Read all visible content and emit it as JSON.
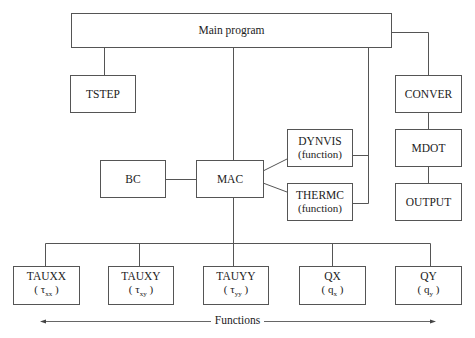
{
  "diagram": {
    "main": {
      "label": "Main program"
    },
    "tstep": {
      "label": "TSTEP"
    },
    "conver": {
      "label": "CONVER"
    },
    "mdot": {
      "label": "MDOT"
    },
    "output": {
      "label": "OUTPUT"
    },
    "bc": {
      "label": "BC"
    },
    "mac": {
      "label": "MAC"
    },
    "dynvis": {
      "label": "DYNVIS",
      "sub": "(function)"
    },
    "thermc": {
      "label": "THERMC",
      "sub": "(function)"
    },
    "functions": [
      {
        "label": "TAUXX",
        "sym": "τ",
        "subscript": "xx"
      },
      {
        "label": "TAUXY",
        "sym": "τ",
        "subscript": "xy"
      },
      {
        "label": "TAUYY",
        "sym": "τ",
        "subscript": "yy"
      },
      {
        "label": "QX",
        "sym": "q",
        "subscript": "x"
      },
      {
        "label": "QY",
        "sym": "q",
        "subscript": "y"
      }
    ],
    "functions_caption": "Functions"
  }
}
